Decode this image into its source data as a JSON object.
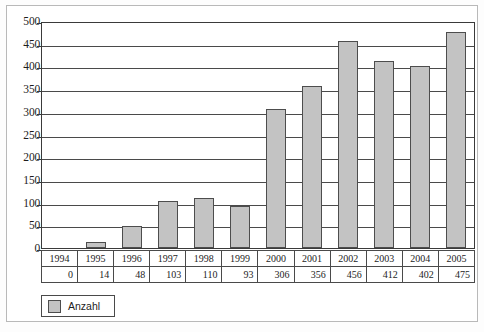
{
  "chart_data": {
    "type": "bar",
    "title": "",
    "subtitle": "",
    "xlabel": "",
    "ylabel": "",
    "categories": [
      "1994",
      "1995",
      "1996",
      "1997",
      "1998",
      "1999",
      "2000",
      "2001",
      "2002",
      "2003",
      "2004",
      "2005"
    ],
    "values": [
      0,
      14,
      48,
      103,
      110,
      93,
      306,
      356,
      456,
      412,
      402,
      475
    ],
    "series": [
      {
        "name": "Anzahl",
        "values": [
          0,
          14,
          48,
          103,
          110,
          93,
          306,
          356,
          456,
          412,
          402,
          475
        ]
      }
    ],
    "ylim": [
      0,
      500
    ],
    "ytick_values": [
      0,
      50,
      100,
      150,
      200,
      250,
      300,
      350,
      400,
      450,
      500
    ],
    "ytick_labels": [
      "0",
      "50",
      "100",
      "150",
      "200",
      "250",
      "300",
      "350",
      "400",
      "450",
      "500"
    ],
    "grid": true,
    "grid_axis": "y",
    "legend_position": "bottom-left",
    "data_table_visible": true,
    "bar_fill_color": "#c3c3c3",
    "bar_border_color": "#4d4d4d",
    "gridline_color": "#4a4a4a",
    "axis_color": "#3a3a3a",
    "background_color": "#ffffff"
  },
  "legend": {
    "entries": [
      {
        "label": "Anzahl",
        "color": "#c3c3c3"
      }
    ]
  },
  "data_table": {
    "row_years_header": "",
    "row_values_header": "",
    "years": [
      "1994",
      "1995",
      "1996",
      "1997",
      "1998",
      "1999",
      "2000",
      "2001",
      "2002",
      "2003",
      "2004",
      "2005"
    ],
    "values": [
      "0",
      "14",
      "48",
      "103",
      "110",
      "93",
      "306",
      "356",
      "456",
      "412",
      "402",
      "475"
    ]
  }
}
